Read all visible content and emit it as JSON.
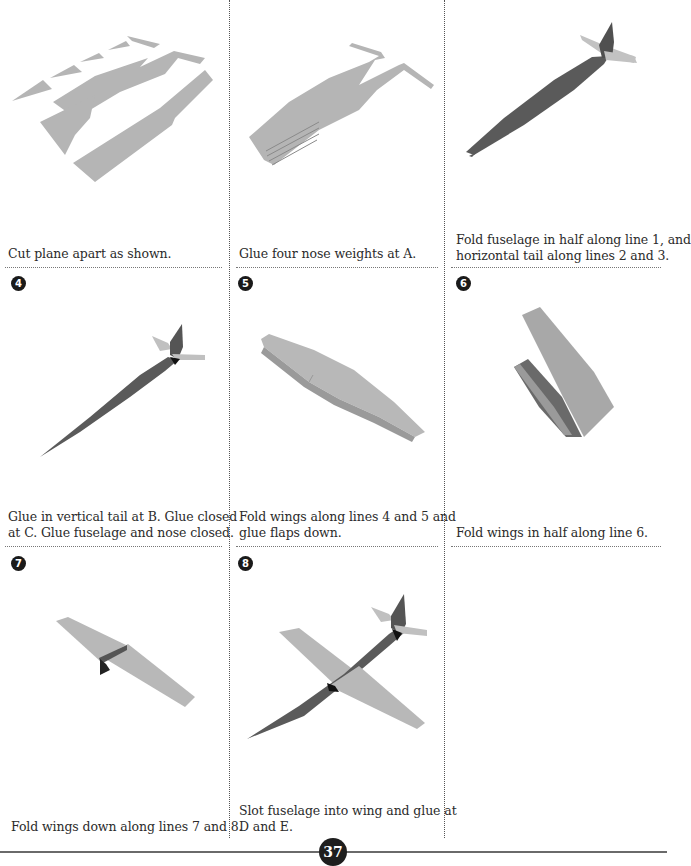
{
  "page_number": "37",
  "colors": {
    "paper_light": "#b4b4b4",
    "paper_dark": "#5a5a5a",
    "rule": "#777777"
  },
  "steps": [
    {
      "number": "",
      "caption_lines": [
        "Cut plane apart as shown."
      ],
      "illustration": "cut-pieces"
    },
    {
      "number": "",
      "caption_lines": [
        "Glue four nose weights at A."
      ],
      "illustration": "nose-weights"
    },
    {
      "number": "",
      "caption_lines": [
        "Fold fuselage in half along line 1, and",
        "horizontal tail along lines 2 and 3."
      ],
      "illustration": "folded-fuselage"
    },
    {
      "number": "4",
      "caption_lines": [
        "Glue in vertical tail at B. Glue closed",
        "at C. Glue fuselage and nose closed."
      ],
      "illustration": "glued-fuselage"
    },
    {
      "number": "5",
      "caption_lines": [
        "Fold wings along lines 4 and 5 and",
        "glue flaps down."
      ],
      "illustration": "folded-wing-flaps"
    },
    {
      "number": "6",
      "caption_lines": [
        "Fold wings in half along line 6."
      ],
      "illustration": "wing-folded-half"
    },
    {
      "number": "7",
      "caption_lines": [
        "Fold wings down along lines 7 and 8."
      ],
      "illustration": "wing-folded-down"
    },
    {
      "number": "8",
      "caption_lines": [
        "Slot fuselage into wing and glue at",
        "D and E."
      ],
      "illustration": "assembled-plane"
    }
  ]
}
